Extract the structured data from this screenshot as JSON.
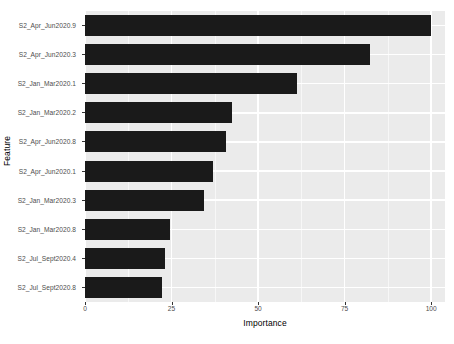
{
  "chart_data": {
    "type": "bar",
    "orientation": "horizontal",
    "title": "",
    "xlabel": "Importance",
    "ylabel": "Feature",
    "xlim": [
      0,
      104
    ],
    "xticks": [
      0,
      25,
      50,
      75,
      100
    ],
    "xtick_labels": [
      "0",
      "25",
      "50",
      "75",
      "100"
    ],
    "grid": true,
    "legend": null,
    "bar_color": "#1a1a1a",
    "panel_color": "#ebebeb",
    "gridline_color": "#ffffff",
    "categories": [
      "S2_Apr_Jun2020.9",
      "S2_Apr_Jun2020.3",
      "S2_Jan_Mar2020.1",
      "S2_Jan_Mar2020.2",
      "S2_Apr_Jun2020.8",
      "S2_Apr_Jun2020.1",
      "S2_Jan_Mar2020.3",
      "S2_Jan_Mar2020.8",
      "S2_Jul_Sept2020.4",
      "S2_Jul_Sept2020.8"
    ],
    "values": [
      100,
      82.4,
      61.3,
      42.6,
      40.7,
      37.1,
      34.4,
      24.6,
      23.0,
      22.3
    ]
  }
}
